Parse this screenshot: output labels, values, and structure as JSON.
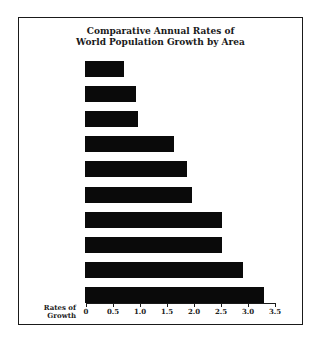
{
  "chart": {
    "title_line1": "Comparative Annual Rates of",
    "title_line2": "World Population Growth by Area",
    "ylabel_line1": "Rates of",
    "ylabel_line2": "Growth"
  },
  "chart_data": {
    "type": "bar",
    "orientation": "horizontal",
    "title": "Comparative Annual Rates of World Population Growth by Area",
    "xlabel": "Rates of Growth",
    "ylabel": "",
    "categories": [
      "Area 1",
      "Area 2",
      "Area 3",
      "Area 4",
      "Area 5",
      "Area 6",
      "Area 7",
      "Area 8",
      "Area 9",
      "Area 10"
    ],
    "values": [
      0.72,
      0.95,
      0.98,
      1.65,
      1.88,
      1.98,
      2.53,
      2.53,
      2.92,
      3.32
    ],
    "xlim": [
      0,
      3.5
    ],
    "xticks": [
      "0",
      "0.5",
      "1.0",
      "1.5",
      "2.0",
      "2.5",
      "3.0",
      "3.5"
    ],
    "grid": false,
    "legend": null,
    "bar_color": "#0a0a0a"
  }
}
